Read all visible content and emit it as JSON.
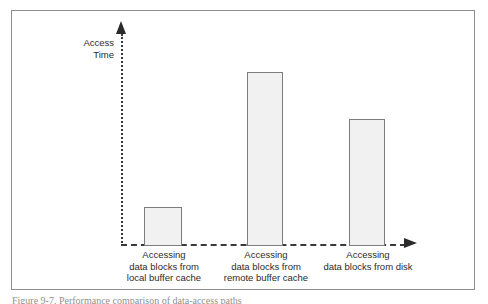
{
  "figure": {
    "caption": "Figure 9-7. Performance comparison of data-access paths",
    "frame_color": "#8d8d8d",
    "background": "#ffffff"
  },
  "axes": {
    "y_title": "Access\nTime",
    "y_axis_style": "dotted",
    "x_axis_style": "dashed",
    "axis_color": "#3a3a3a",
    "arrow_color": "#2b2b2b"
  },
  "chart_data": {
    "type": "bar",
    "title": "",
    "subtitle": "",
    "xlabel": "",
    "ylabel": "Access Time",
    "categories": [
      "Accessing\ndata blocks from\nlocal buffer cache",
      "Accessing\ndata blocks from\nremote buffer cache",
      "Accessing\ndata blocks from disk"
    ],
    "values": [
      16,
      81,
      59
    ],
    "ylim": [
      0,
      105
    ],
    "grid": false,
    "legend": false,
    "bar_fill": "#f1f1f1",
    "bar_stroke": "#7d7d7d",
    "axis_ticks": [],
    "annotations": []
  },
  "bars": [
    {
      "label_lines": "Accessing\ndata blocks from\nlocal buffer cache",
      "left": 132,
      "top": 196,
      "width": 38,
      "height": 39,
      "label_left": 104,
      "label_top": 238,
      "label_width": 96
    },
    {
      "label_lines": "Accessing\ndata blocks from\nremote buffer cache",
      "left": 235,
      "top": 61,
      "width": 36,
      "height": 174,
      "label_left": 204,
      "label_top": 238,
      "label_width": 100
    },
    {
      "label_lines": "Accessing\ndata blocks from disk",
      "left": 337,
      "top": 108,
      "width": 36,
      "height": 127,
      "label_left": 305,
      "label_top": 238,
      "label_width": 102
    }
  ]
}
